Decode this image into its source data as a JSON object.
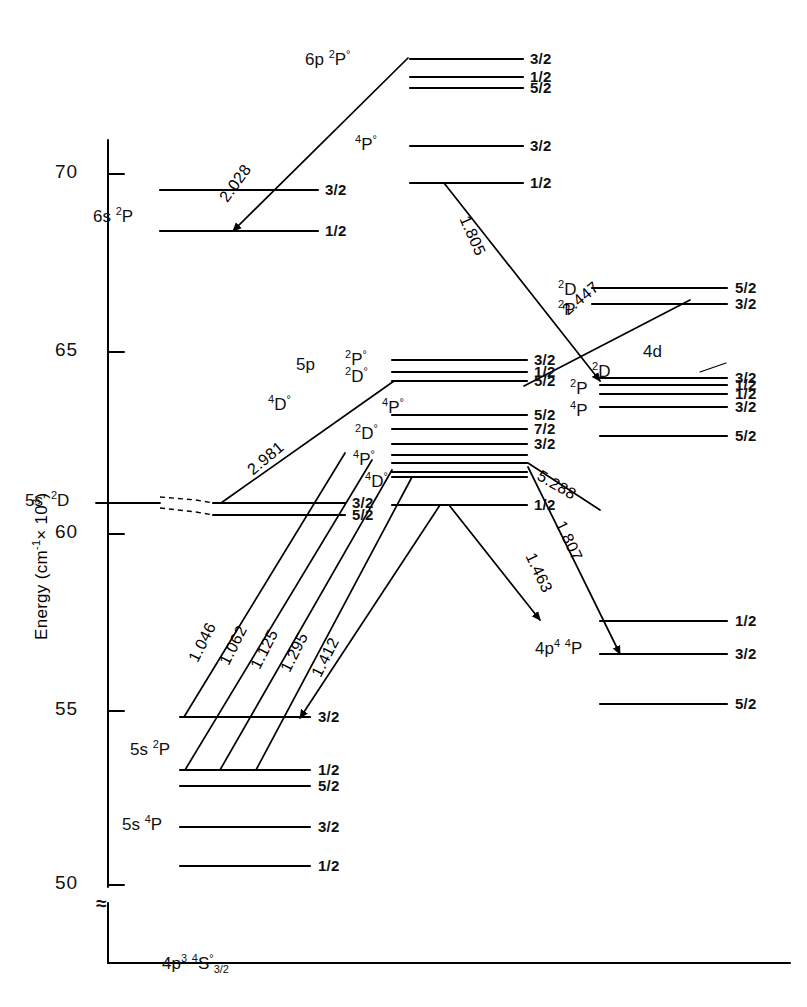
{
  "figure": {
    "type": "energy-level-diagram",
    "axis": {
      "title": "Energy (cm-1 X 103)",
      "title_parts": {
        "name": "Energy",
        "open": "(cm",
        "sup1": "-1",
        "mult": "× 10",
        "sup2": "3",
        "close": ")"
      },
      "ticks": [
        {
          "label": "70",
          "value": 70,
          "y": 174
        },
        {
          "label": "65",
          "value": 65,
          "y": 352
        },
        {
          "label": "60",
          "value": 60,
          "y": 534
        },
        {
          "label": "55",
          "value": 55,
          "y": 711
        },
        {
          "label": "50",
          "value": 50,
          "y": 885
        }
      ],
      "break_symbol": "≈",
      "units": "cm⁻¹ × 10³"
    },
    "configuration_labels": [
      {
        "id": "6p-2Po",
        "text": "6p ²P°",
        "base": "6p",
        "multiplicity": "2",
        "term": "P",
        "parity": "°",
        "x": 305,
        "y": 48
      },
      {
        "id": "4Po-top",
        "text": "⁴P°",
        "multiplicity": "4",
        "term": "P",
        "parity": "°",
        "x": 355,
        "y": 133
      },
      {
        "id": "6s-2P",
        "text": "6s²P",
        "base": "6s",
        "multiplicity": "2",
        "term": "P",
        "x": 93,
        "y": 205
      },
      {
        "id": "5p",
        "text": "5p",
        "x": 296,
        "y": 355
      },
      {
        "id": "5p-2Po",
        "text": "²P°",
        "multiplicity": "2",
        "term": "P",
        "parity": "°",
        "x": 345,
        "y": 348
      },
      {
        "id": "5p-2Do",
        "text": "²D°",
        "multiplicity": "2",
        "term": "D",
        "parity": "°",
        "x": 345,
        "y": 365
      },
      {
        "id": "4Do",
        "text": "⁴D°",
        "multiplicity": "4",
        "term": "D",
        "parity": "°",
        "x": 268,
        "y": 393
      },
      {
        "id": "4Po-5p",
        "text": "⁴P°",
        "multiplicity": "4",
        "term": "P",
        "parity": "°",
        "x": 382,
        "y": 396
      },
      {
        "id": "2Do-5p",
        "text": "²D°",
        "multiplicity": "2",
        "term": "D",
        "parity": "°",
        "x": 355,
        "y": 422
      },
      {
        "id": "4Po-low",
        "text": "⁴P°",
        "multiplicity": "4",
        "term": "P",
        "parity": "°",
        "x": 353,
        "y": 448
      },
      {
        "id": "4Do-low",
        "text": "⁴D°",
        "multiplicity": "4",
        "term": "D",
        "parity": "°",
        "x": 365,
        "y": 470
      },
      {
        "id": "5s-prime-2D",
        "text": "5s′ ²D",
        "base": "5s′",
        "multiplicity": "2",
        "term": "D",
        "x": 25,
        "y": 489
      },
      {
        "id": "2D-4d-top",
        "text": "²D",
        "multiplicity": "2",
        "term": "D",
        "x": 558,
        "y": 278
      },
      {
        "id": "2P-4d-top",
        "text": "²P",
        "multiplicity": "2",
        "term": "P",
        "x": 558,
        "y": 298
      },
      {
        "id": "4d",
        "text": "4d",
        "x": 643,
        "y": 342
      },
      {
        "id": "2D-4d",
        "text": "²D",
        "multiplicity": "2",
        "term": "D",
        "x": 592,
        "y": 360
      },
      {
        "id": "2P-4d",
        "text": "²P",
        "multiplicity": "2",
        "term": "P",
        "x": 570,
        "y": 377
      },
      {
        "id": "4P-4d",
        "text": "⁴P",
        "multiplicity": "4",
        "term": "P",
        "x": 570,
        "y": 399
      },
      {
        "id": "5s-2P",
        "text": "5s ²P",
        "base": "5s",
        "multiplicity": "2",
        "term": "P",
        "x": 130,
        "y": 738
      },
      {
        "id": "5s-4P",
        "text": "5s ⁴P",
        "base": "5s",
        "multiplicity": "4",
        "term": "P",
        "x": 122,
        "y": 813
      },
      {
        "id": "4p4-4P",
        "text": "4p⁴ ⁴P",
        "base": "4p",
        "base_sup": "4",
        "multiplicity": "4",
        "term": "P",
        "x": 535,
        "y": 637
      },
      {
        "id": "ground",
        "text": "4p³ ⁴S° 3/2",
        "base": "4p",
        "base_sup": "3",
        "multiplicity": "4",
        "term": "S",
        "parity": "°",
        "j": "3/2",
        "x": 162,
        "y": 952
      }
    ],
    "levels": [
      {
        "group": "6p-2Po",
        "j": "3/2",
        "y": 59,
        "x1": 410,
        "x2": 523,
        "label_x": 530
      },
      {
        "group": "6p-2Po",
        "j": "1/2",
        "y": 77,
        "x1": 410,
        "x2": 523,
        "label_x": 530
      },
      {
        "group": "6p-2Po",
        "j": "5/2",
        "y": 88,
        "x1": 410,
        "x2": 523,
        "label_x": 530
      },
      {
        "group": "4Po-top",
        "j": "3/2",
        "y": 146,
        "x1": 410,
        "x2": 523,
        "label_x": 530
      },
      {
        "group": "4Po-top",
        "j": "1/2",
        "y": 183,
        "x1": 410,
        "x2": 523,
        "label_x": 530
      },
      {
        "group": "6s-2P",
        "j": "3/2",
        "y": 190,
        "x1": 160,
        "x2": 318,
        "label_x": 325
      },
      {
        "group": "6s-2P",
        "j": "1/2",
        "y": 231,
        "x1": 160,
        "x2": 318,
        "label_x": 325
      },
      {
        "group": "2D-top",
        "j": "5/2",
        "y": 288,
        "x1": 592,
        "x2": 727,
        "label_x": 735
      },
      {
        "group": "2P-top",
        "j": "3/2",
        "y": 304,
        "x1": 592,
        "x2": 727,
        "label_x": 735
      },
      {
        "group": "5p-2Po",
        "j": "3/2",
        "y": 360,
        "x1": 392,
        "x2": 527,
        "label_x": 534
      },
      {
        "group": "5p-2Po",
        "j": "1/2",
        "y": 372,
        "x1": 392,
        "x2": 527,
        "label_x": 534
      },
      {
        "group": "5p-2Do",
        "j": "5/2",
        "y": 381,
        "x1": 392,
        "x2": 527,
        "label_x": 534
      },
      {
        "group": "4Po-5p",
        "j": "5/2",
        "y": 415,
        "x1": 392,
        "x2": 527,
        "label_x": 534
      },
      {
        "group": "2Do-5p",
        "j": "7/2",
        "y": 429,
        "x1": 392,
        "x2": 527,
        "label_x": 534
      },
      {
        "group": "2Do-5p",
        "j": "3/2",
        "y": 444,
        "x1": 392,
        "x2": 527,
        "label_x": 534
      },
      {
        "group": "4Po-low",
        "j": "",
        "y": 455,
        "x1": 392,
        "x2": 527,
        "label_x": 534
      },
      {
        "group": "4Po-low",
        "j": "",
        "y": 463,
        "x1": 392,
        "x2": 527,
        "label_x": 534
      },
      {
        "group": "4Do-low",
        "j": "",
        "y": 472,
        "x1": 392,
        "x2": 527,
        "label_x": 534
      },
      {
        "group": "4Do-low",
        "j": "",
        "y": 477,
        "x1": 392,
        "x2": 527,
        "label_x": 534
      },
      {
        "group": "5p-low",
        "j": "1/2",
        "y": 505,
        "x1": 392,
        "x2": 527,
        "label_x": 534
      },
      {
        "group": "5s-prime-2D",
        "j": "3/2",
        "y": 503,
        "x1": 213,
        "x2": 345,
        "label_x": 352
      },
      {
        "group": "5s-prime-2D",
        "j": "5/2",
        "y": 515,
        "x1": 213,
        "x2": 345,
        "label_x": 352
      },
      {
        "group": "2D-4d",
        "j": "3/2",
        "y": 378,
        "x1": 600,
        "x2": 727,
        "label_x": 735
      },
      {
        "group": "2P-4d",
        "j": "1/2",
        "y": 385,
        "x1": 600,
        "x2": 727,
        "label_x": 735
      },
      {
        "group": "2P-4d",
        "j": "1/2",
        "y": 394,
        "x1": 600,
        "x2": 727,
        "label_x": 735
      },
      {
        "group": "4P-4d",
        "j": "3/2",
        "y": 407,
        "x1": 600,
        "x2": 727,
        "label_x": 735
      },
      {
        "group": "4P-4d",
        "j": "5/2",
        "y": 436,
        "x1": 600,
        "x2": 727,
        "label_x": 735
      },
      {
        "group": "4p4-4P",
        "j": "1/2",
        "y": 621,
        "x1": 600,
        "x2": 727,
        "label_x": 735
      },
      {
        "group": "4p4-4P",
        "j": "3/2",
        "y": 654,
        "x1": 600,
        "x2": 727,
        "label_x": 735
      },
      {
        "group": "4p4-4P",
        "j": "5/2",
        "y": 704,
        "x1": 600,
        "x2": 727,
        "label_x": 735
      },
      {
        "group": "5s-2P",
        "j": "3/2",
        "y": 717,
        "x1": 180,
        "x2": 310,
        "label_x": 318
      },
      {
        "group": "5s-2P",
        "j": "1/2",
        "y": 770,
        "x1": 180,
        "x2": 310,
        "label_x": 318
      },
      {
        "group": "5s-2P",
        "j": "5/2",
        "y": 786,
        "x1": 180,
        "x2": 310,
        "label_x": 318
      },
      {
        "group": "5s-4P",
        "j": "3/2",
        "y": 827,
        "x1": 180,
        "x2": 310,
        "label_x": 318
      },
      {
        "group": "5s-4P",
        "j": "1/2",
        "y": 866,
        "x1": 180,
        "x2": 310,
        "label_x": 318
      },
      {
        "group": "ground",
        "j": "",
        "y": 963,
        "x1": 248,
        "x2": 790,
        "label_x": 0
      }
    ],
    "transitions": [
      {
        "wavelength": "2.028",
        "label_x": 216,
        "label_y": 195,
        "angle": -54,
        "x1": 233,
        "y1": 231,
        "x2": 408,
        "y2": 58,
        "arrow": "start"
      },
      {
        "wavelength": "1.805",
        "label_x": 472,
        "label_y": 213,
        "angle": 66,
        "x1": 444,
        "y1": 183,
        "x2": 600,
        "y2": 381,
        "arrow": "end"
      },
      {
        "wavelength": "2.447",
        "label_x": 559,
        "label_y": 305,
        "angle": -40,
        "x1": 524,
        "y1": 386,
        "x2": 690,
        "y2": 300,
        "arrow": "none"
      },
      {
        "wavelength": "2.981",
        "label_x": 244,
        "label_y": 465,
        "angle": -40,
        "x1": 221,
        "y1": 503,
        "x2": 394,
        "y2": 381,
        "arrow": "none"
      },
      {
        "wavelength": "5.288",
        "label_x": 543,
        "label_y": 467,
        "angle": 30,
        "x1": 528,
        "y1": 463,
        "x2": 600,
        "y2": 510,
        "arrow": "none"
      },
      {
        "wavelength": "1.807",
        "label_x": 568,
        "label_y": 518,
        "angle": 65,
        "x1": 528,
        "y1": 467,
        "x2": 620,
        "y2": 654,
        "arrow": "end"
      },
      {
        "wavelength": "1.463",
        "label_x": 538,
        "label_y": 550,
        "angle": 65,
        "x1": 449,
        "y1": 505,
        "x2": 540,
        "y2": 620,
        "arrow": "end"
      },
      {
        "wavelength": "1.046",
        "label_x": 185,
        "label_y": 657,
        "angle": -63,
        "x1": 184,
        "y1": 717,
        "x2": 345,
        "y2": 453,
        "arrow": "none"
      },
      {
        "wavelength": "1.062",
        "label_x": 216,
        "label_y": 660,
        "angle": -63,
        "x1": 185,
        "y1": 770,
        "x2": 372,
        "y2": 460,
        "arrow": "none"
      },
      {
        "wavelength": "1.125",
        "label_x": 247,
        "label_y": 664,
        "angle": -63,
        "x1": 220,
        "y1": 770,
        "x2": 392,
        "y2": 470,
        "arrow": "none"
      },
      {
        "wavelength": "1.295",
        "label_x": 277,
        "label_y": 667,
        "angle": -63,
        "x1": 256,
        "y1": 770,
        "x2": 412,
        "y2": 477,
        "arrow": "none"
      },
      {
        "wavelength": "1.412",
        "label_x": 308,
        "label_y": 672,
        "angle": -63,
        "x1": 300,
        "y1": 718,
        "x2": 440,
        "y2": 505,
        "arrow": "start"
      }
    ]
  }
}
